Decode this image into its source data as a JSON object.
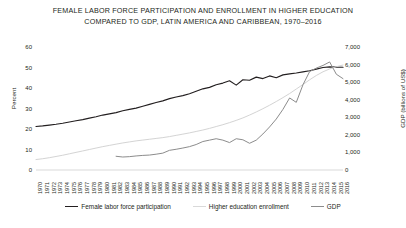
{
  "chart_data": {
    "type": "line",
    "title": "FEMALE LABOR FORCE PARTICIPATION AND ENROLLMENT IN HIGHER EDUCATION COMPARED TO GDP, LATIN AMERICA AND CARIBBEAN, 1970–2016",
    "title_line1": "FEMALE LABOR FORCE PARTICIPATION AND ENROLLMENT IN HIGHER EDUCATION",
    "title_line2": "COMPARED TO GDP, LATIN AMERICA AND CARIBBEAN, 1970–2016",
    "xlabel": "",
    "ylabel": "Percent",
    "ylabel_secondary": "GDP (billions of US$)",
    "ylim": [
      0,
      60
    ],
    "ylim_secondary": [
      0,
      7000
    ],
    "yticks": [
      0,
      10,
      20,
      30,
      40,
      50,
      60
    ],
    "ytick_labels": [
      "0",
      "10",
      "20",
      "30",
      "40",
      "50",
      "60"
    ],
    "yticks_secondary": [
      0,
      1000,
      2000,
      3000,
      4000,
      5000,
      6000,
      7000
    ],
    "ytick_labels_secondary": [
      "0",
      "1,000",
      "2,000",
      "3,000",
      "4,000",
      "5,000",
      "6,000",
      "7,000"
    ],
    "grid": false,
    "legend_position": "bottom",
    "x": [
      1970,
      1971,
      1972,
      1973,
      1974,
      1975,
      1976,
      1977,
      1978,
      1979,
      1980,
      1981,
      1982,
      1983,
      1984,
      1985,
      1986,
      1987,
      1988,
      1989,
      1990,
      1991,
      1992,
      1993,
      1994,
      1995,
      1996,
      1997,
      1998,
      1999,
      2000,
      2001,
      2002,
      2003,
      2004,
      2005,
      2006,
      2007,
      2008,
      2009,
      2010,
      2011,
      2012,
      2013,
      2014,
      2015,
      2016
    ],
    "series": [
      {
        "name": "Female labor force participation",
        "axis": "left",
        "unit": "percent",
        "color": "#231f20",
        "values": [
          21.2,
          21.5,
          21.9,
          22.3,
          22.8,
          23.4,
          24.0,
          24.6,
          25.3,
          26.0,
          26.8,
          27.4,
          28.0,
          28.9,
          29.6,
          30.2,
          31.1,
          32.0,
          32.9,
          33.7,
          34.8,
          35.6,
          36.3,
          37.2,
          38.4,
          39.6,
          40.3,
          41.6,
          42.4,
          43.5,
          41.4,
          44.0,
          43.8,
          45.3,
          44.6,
          45.9,
          45.0,
          46.4,
          46.9,
          47.3,
          47.9,
          48.4,
          49.2,
          50.0,
          50.3,
          50.2,
          50.1
        ]
      },
      {
        "name": "Higher education enrollment",
        "axis": "left",
        "unit": "percent",
        "color": "#d4d4d4",
        "values": [
          5.1,
          5.5,
          6.0,
          6.6,
          7.2,
          7.9,
          8.6,
          9.3,
          10.0,
          10.7,
          11.4,
          12.0,
          12.6,
          13.2,
          13.7,
          14.2,
          14.6,
          15.0,
          15.4,
          15.8,
          16.3,
          16.9,
          17.5,
          18.1,
          18.8,
          19.5,
          20.3,
          21.2,
          22.1,
          23.1,
          24.2,
          25.4,
          26.8,
          28.3,
          29.9,
          31.6,
          33.4,
          35.3,
          37.3,
          39.5,
          41.7,
          44.0,
          46.1,
          47.9,
          49.3,
          50.4,
          51.2
        ]
      },
      {
        "name": "GDP",
        "axis": "right",
        "unit": "billions of US$",
        "color": "#8c8c8c",
        "values": [
          null,
          null,
          null,
          null,
          null,
          null,
          null,
          null,
          null,
          null,
          null,
          null,
          780,
          740,
          760,
          800,
          830,
          850,
          900,
          960,
          1120,
          1180,
          1250,
          1330,
          1450,
          1620,
          1700,
          1780,
          1700,
          1560,
          1780,
          1720,
          1520,
          1700,
          2050,
          2450,
          2900,
          3450,
          4100,
          3850,
          4850,
          5600,
          5800,
          5950,
          6150,
          5450,
          5200
        ]
      }
    ]
  },
  "legend": {
    "items": [
      {
        "label": "Female labor force participation",
        "color": "#231f20"
      },
      {
        "label": "Higher education enrollment",
        "color": "#d9d9d9"
      },
      {
        "label": "GDP",
        "color": "#8c8c8c"
      }
    ]
  }
}
